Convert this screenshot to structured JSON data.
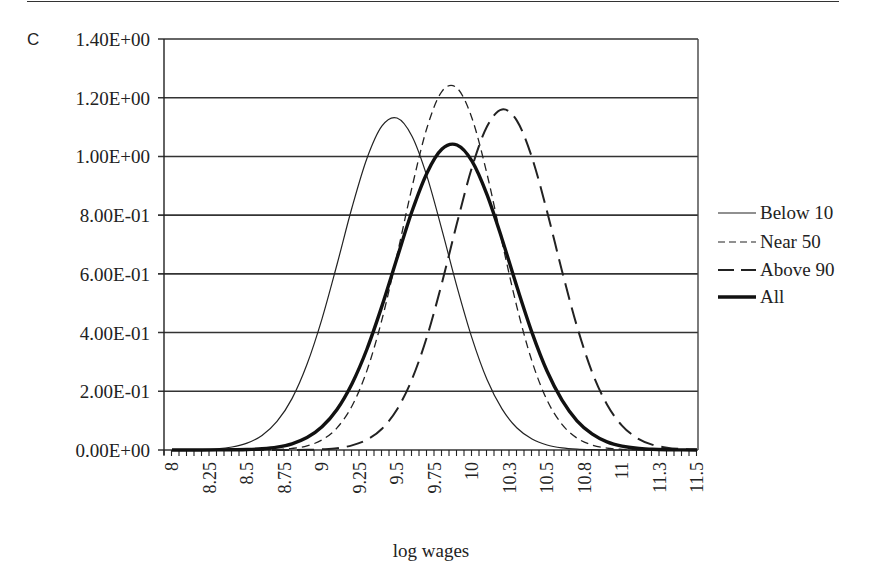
{
  "panel_letter": "C",
  "chart_data": {
    "type": "line",
    "title": "",
    "xlabel": "log wages",
    "ylabel": "",
    "xlim": [
      8,
      11.5
    ],
    "ylim": [
      0,
      1.4
    ],
    "grid": {
      "horizontal": true,
      "vertical": false
    },
    "legend_position": "right",
    "y_ticks": [
      "0.00E+00",
      "2.00E-01",
      "4.00E-01",
      "6.00E-01",
      "8.00E-01",
      "1.00E+00",
      "1.20E+00",
      "1.40E+00"
    ],
    "y_tick_values": [
      0,
      0.2,
      0.4,
      0.6,
      0.8,
      1.0,
      1.2,
      1.4
    ],
    "x_ticks": [
      "8",
      "8.25",
      "8.5",
      "8.75",
      "9",
      "9.25",
      "9.5",
      "9.75",
      "10",
      "10.3",
      "10.5",
      "10.8",
      "11",
      "11.3",
      "11.5"
    ],
    "x_tick_values": [
      8,
      8.25,
      8.5,
      8.75,
      9,
      9.25,
      9.5,
      9.75,
      10,
      10.25,
      10.5,
      10.75,
      11,
      11.25,
      11.5
    ],
    "x": [
      8.0,
      8.1,
      8.2,
      8.3,
      8.4,
      8.5,
      8.6,
      8.7,
      8.8,
      8.9,
      9.0,
      9.1,
      9.2,
      9.3,
      9.4,
      9.5,
      9.6,
      9.7,
      9.8,
      9.9,
      10.0,
      10.1,
      10.2,
      10.3,
      10.4,
      10.5,
      10.6,
      10.7,
      10.8,
      10.9,
      11.0,
      11.1,
      11.2,
      11.3,
      11.4,
      11.5
    ],
    "series": [
      {
        "name": "Below 10",
        "style": "thin-solid",
        "peak_x": 9.48,
        "peak_y": 1.13,
        "values": [
          0.0002,
          0.0005,
          0.0015,
          0.0041,
          0.0102,
          0.0234,
          0.0498,
          0.0973,
          0.175,
          0.292,
          0.447,
          0.632,
          0.826,
          0.994,
          1.104,
          1.131,
          1.069,
          0.932,
          0.749,
          0.556,
          0.381,
          0.24,
          0.14,
          0.075,
          0.0373,
          0.017,
          0.0072,
          0.0028,
          0.001,
          0.0003,
          0.0001,
          0,
          0,
          0,
          0,
          0
        ]
      },
      {
        "name": "Near 50",
        "style": "short-dash",
        "peak_x": 9.86,
        "peak_y": 1.24,
        "values": [
          0,
          0,
          0,
          0,
          0,
          0.0002,
          0.0006,
          0.0018,
          0.0053,
          0.0142,
          0.0343,
          0.0753,
          0.15,
          0.271,
          0.445,
          0.663,
          0.895,
          1.098,
          1.222,
          1.233,
          1.13,
          0.94,
          0.709,
          0.486,
          0.302,
          0.17,
          0.0873,
          0.0405,
          0.0171,
          0.0065,
          0.0023,
          0.0007,
          0.0002,
          0,
          0,
          0
        ]
      },
      {
        "name": "Above 90",
        "style": "long-dash",
        "peak_x": 10.21,
        "peak_y": 1.16,
        "values": [
          0,
          0,
          0,
          0,
          0,
          0,
          0,
          0,
          0.0003,
          0.0008,
          0.0024,
          0.0063,
          0.0156,
          0.035,
          0.0725,
          0.138,
          0.241,
          0.386,
          0.57,
          0.773,
          0.963,
          1.102,
          1.16,
          1.121,
          0.996,
          0.813,
          0.61,
          0.421,
          0.266,
          0.155,
          0.083,
          0.0409,
          0.0184,
          0.0077,
          0.0029,
          0.001
        ]
      },
      {
        "name": "All",
        "style": "thick-solid",
        "peak_x": 9.87,
        "peak_y": 1.04,
        "values": [
          0,
          0,
          0.0001,
          0.0002,
          0.0007,
          0.0017,
          0.0043,
          0.0098,
          0.0211,
          0.0422,
          0.079,
          0.138,
          0.226,
          0.344,
          0.491,
          0.653,
          0.813,
          0.944,
          1.025,
          1.039,
          0.984,
          0.87,
          0.719,
          0.555,
          0.4,
          0.269,
          0.17,
          0.0996,
          0.0547,
          0.028,
          0.0134,
          0.006,
          0.0025,
          0.001,
          0.0003,
          0.0001
        ]
      }
    ]
  },
  "legend": {
    "items": [
      {
        "label": "Below 10"
      },
      {
        "label": "Near 50"
      },
      {
        "label": "Above 90"
      },
      {
        "label": "All"
      }
    ]
  },
  "colors": {
    "line": "#222222",
    "grid": "#333333",
    "background": "#ffffff"
  }
}
